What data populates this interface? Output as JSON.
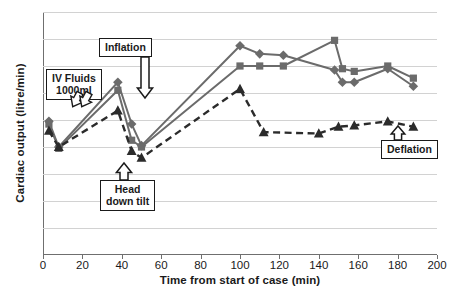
{
  "chart_data": {
    "type": "line",
    "title": "",
    "xlabel": "Time from start of case (min)",
    "ylabel": "Cardiac output (litre/min)",
    "xlim": [
      0,
      200
    ],
    "ylim": [
      0,
      9
    ],
    "xticks": [
      0,
      20,
      40,
      60,
      80,
      100,
      120,
      140,
      160,
      180,
      200
    ],
    "yticks": [
      0,
      1,
      2,
      3,
      4,
      5,
      6,
      7,
      8,
      9
    ],
    "grid": true,
    "legend": "none",
    "series": [
      {
        "name": "series-diamond",
        "marker": "diamond",
        "style": "solid",
        "color": "#6b6b6b",
        "points": [
          [
            3,
            4.95
          ],
          [
            8,
            4.0
          ],
          [
            38,
            6.4
          ],
          [
            45,
            4.85
          ],
          [
            50,
            4.05
          ],
          [
            100,
            7.75
          ],
          [
            110,
            7.45
          ],
          [
            122,
            7.4
          ],
          [
            148,
            6.85
          ],
          [
            152,
            6.4
          ],
          [
            158,
            6.4
          ],
          [
            175,
            6.9
          ],
          [
            188,
            6.25
          ]
        ]
      },
      {
        "name": "series-square",
        "marker": "square",
        "style": "solid",
        "color": "#6b6b6b",
        "points": [
          [
            3,
            4.85
          ],
          [
            8,
            3.95
          ],
          [
            38,
            6.1
          ],
          [
            45,
            4.25
          ],
          [
            50,
            4.0
          ],
          [
            100,
            7.0
          ],
          [
            110,
            7.0
          ],
          [
            122,
            7.0
          ],
          [
            148,
            7.95
          ],
          [
            152,
            6.9
          ],
          [
            158,
            6.8
          ],
          [
            175,
            7.0
          ],
          [
            188,
            6.55
          ]
        ]
      },
      {
        "name": "series-triangle",
        "marker": "triangle",
        "style": "dashed",
        "color": "#2b2b2b",
        "points": [
          [
            3,
            4.6
          ],
          [
            8,
            4.0
          ],
          [
            38,
            5.35
          ],
          [
            45,
            3.85
          ],
          [
            50,
            3.6
          ],
          [
            100,
            6.15
          ],
          [
            112,
            4.55
          ],
          [
            140,
            4.5
          ],
          [
            150,
            4.75
          ],
          [
            158,
            4.8
          ],
          [
            175,
            4.95
          ],
          [
            188,
            4.75
          ]
        ]
      }
    ],
    "annotations": [
      {
        "name": "iv-fluids",
        "label": "IV Fluids\n1000ml",
        "text_line1": "IV Fluids",
        "text_line2": "1000ml"
      },
      {
        "name": "inflation",
        "label": "Inflation",
        "text_line1": "Inflation"
      },
      {
        "name": "head-down-tilt",
        "label": "Head\ndown tilt",
        "text_line1": "Head",
        "text_line2": "down tilt"
      },
      {
        "name": "deflation",
        "label": "Deflation",
        "text_line1": "Deflation"
      }
    ]
  }
}
